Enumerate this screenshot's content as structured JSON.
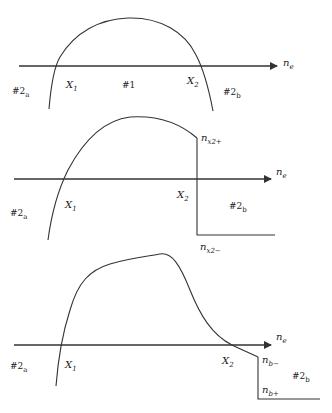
{
  "panels": [
    {
      "id": "panel-1",
      "axis_label": {
        "base": "n",
        "sub": "e"
      },
      "labels": {
        "left_region": {
          "base": "#2",
          "sub": "a"
        },
        "x1": {
          "base": "X",
          "sub": "1"
        },
        "center_region": "#1",
        "x2": {
          "base": "X",
          "sub": "2"
        },
        "right_region": {
          "base": "#2",
          "sub": "b"
        }
      }
    },
    {
      "id": "panel-2",
      "axis_label": {
        "base": "n",
        "sub": "e"
      },
      "labels": {
        "left_region": {
          "base": "#2",
          "sub": "a"
        },
        "x1": {
          "base": "X",
          "sub": "1"
        },
        "x2": {
          "base": "X",
          "sub": "2"
        },
        "right_region": {
          "base": "#2",
          "sub": "b"
        },
        "upper_value": {
          "base": "n",
          "sub": "x2+"
        },
        "lower_value": {
          "base": "n",
          "sub": "x2−"
        }
      }
    },
    {
      "id": "panel-3",
      "axis_label": {
        "base": "n",
        "sub": "e"
      },
      "labels": {
        "left_region": {
          "base": "#2",
          "sub": "a"
        },
        "x1": {
          "base": "X",
          "sub": "1"
        },
        "x2": {
          "base": "X",
          "sub": "2"
        },
        "right_region": {
          "base": "#2",
          "sub": "b"
        },
        "upper_value": {
          "base": "n",
          "sub": "b−"
        },
        "lower_value": {
          "base": "n",
          "sub": "b+"
        }
      }
    }
  ]
}
